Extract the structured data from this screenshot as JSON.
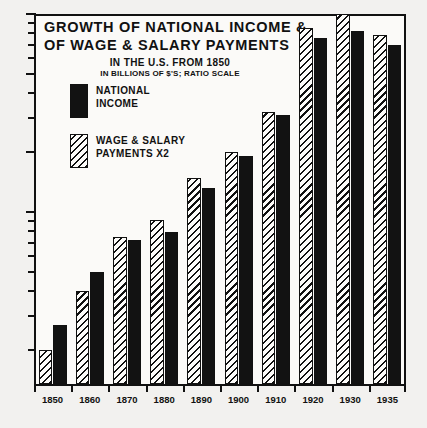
{
  "chart_data": {
    "type": "bar",
    "title": "GROWTH OF NATIONAL INCOME & OF WAGE & SALARY PAYMENTS",
    "title_line1": "GROWTH OF NATIONAL INCOME &",
    "title_line2": "OF WAGE & SALARY PAYMENTS",
    "subtitle": "IN THE U.S. FROM 1850",
    "subtitle2": "IN BILLIONS OF $'S; RATIO SCALE",
    "xlabel": "",
    "ylabel": "",
    "scale": "log",
    "ylim": [
      0.15,
      10
    ],
    "grid": false,
    "legend_position": "top-left-inside",
    "y_ticks_labeled": [
      "10",
      "5",
      "2",
      "1"
    ],
    "y_tick_values": [
      10,
      5,
      2,
      1
    ],
    "y_minor_ticks": [
      9,
      8,
      7,
      6,
      4,
      3,
      0.9,
      0.8,
      0.7,
      0.6,
      0.5,
      0.4,
      0.3,
      0.2
    ],
    "categories": [
      "1850",
      "1860",
      "1870",
      "1880",
      "1890",
      "1900",
      "1910",
      "1920",
      "1930",
      "1935"
    ],
    "series": [
      {
        "name": "WAGE & SALARY PAYMENTS X2",
        "label_line1": "WAGE & SALARY",
        "label_line2": "PAYMENTS X2",
        "pattern": "hatch",
        "color": "#111111",
        "values": [
          0.2,
          0.4,
          0.75,
          0.91,
          1.48,
          2.0,
          3.2,
          8.5,
          10.0,
          7.8
        ]
      },
      {
        "name": "NATIONAL INCOME",
        "label_line1": "NATIONAL",
        "label_line2": "INCOME",
        "pattern": "solid",
        "color": "#121212",
        "values": [
          0.27,
          0.5,
          0.72,
          0.79,
          1.32,
          1.91,
          3.1,
          7.6,
          8.2,
          7.0
        ]
      }
    ]
  }
}
